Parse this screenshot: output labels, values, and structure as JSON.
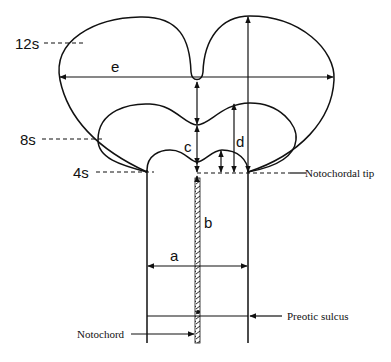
{
  "diagram": {
    "stage_labels": [
      {
        "id": "12s",
        "text": "12s"
      },
      {
        "id": "8s",
        "text": "8s"
      },
      {
        "id": "4s",
        "text": "4s"
      }
    ],
    "measurement_labels": {
      "a": "a",
      "b": "b",
      "c": "c",
      "d": "d",
      "e": "e"
    },
    "annotations": {
      "notochordal_tip": "Notochordal tip",
      "preotic_sulcus": "Preotic sulcus",
      "notochord": "Notochord"
    },
    "colors": {
      "line": "#111111",
      "background": "#ffffff"
    }
  }
}
